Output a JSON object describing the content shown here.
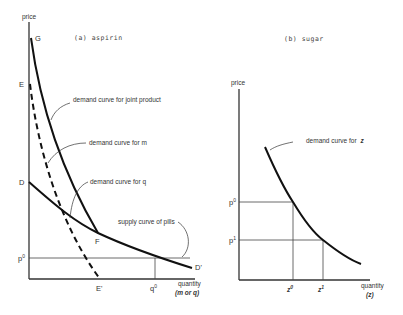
{
  "panel_a": {
    "title": "(a) aspirin",
    "y_axis_label": "price",
    "x_axis_label": "quantity",
    "x_axis_sublabel": "(m or q)",
    "points": {
      "G": "G",
      "E": "E",
      "D": "D",
      "F": "F",
      "E_prime": "E'",
      "D_prime": "D'",
      "p0": "p",
      "p0_sup": "0",
      "q0": "q",
      "q0_sup": "0"
    },
    "annotations": {
      "joint": "demand curve for joint product",
      "m": "demand curve for m",
      "q": "demand curve for q",
      "supply": "supply curve of pills"
    }
  },
  "panel_b": {
    "title": "(b) sugar",
    "y_axis_label": "price",
    "x_axis_label": "quantity",
    "x_axis_sublabel": "(z)",
    "points": {
      "p0": "p",
      "p0_sup": "0",
      "p1": "p",
      "p1_sup": "1",
      "z0": "z",
      "z0_sup": "0",
      "z1": "z",
      "z1_sup": "1"
    },
    "annotations": {
      "z_prefix": "demand curve for",
      "z_var": "z"
    }
  }
}
